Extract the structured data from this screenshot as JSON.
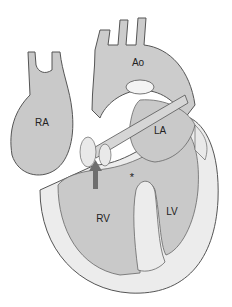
{
  "diagram": {
    "labels": {
      "ra": {
        "text": "RA",
        "x": 42,
        "y": 122
      },
      "ao": {
        "text": "Ao",
        "x": 138,
        "y": 62
      },
      "la": {
        "text": "LA",
        "x": 160,
        "y": 130
      },
      "rv": {
        "text": "RV",
        "x": 103,
        "y": 218
      },
      "lv": {
        "text": "LV",
        "x": 172,
        "y": 211
      },
      "star": {
        "text": "*",
        "x": 132,
        "y": 175
      }
    },
    "arrow": {
      "direction": "up",
      "color": "#6e6e6e"
    },
    "colors": {
      "chamber_fill": "#c6c6c6",
      "wall_fill": "#eeeeee",
      "outline": "#555555",
      "background": "#ffffff"
    }
  }
}
